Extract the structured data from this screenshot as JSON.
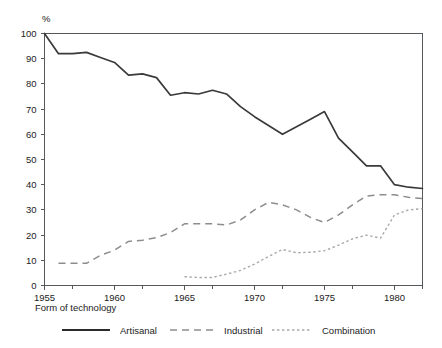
{
  "chart_data": {
    "type": "line",
    "title": "",
    "subtitle": "",
    "xlabel": "",
    "ylabel": "%",
    "unit_label": "%",
    "xlim": [
      1955,
      1982
    ],
    "ylim": [
      0,
      100
    ],
    "grid": false,
    "legend_position": "bottom",
    "legend_title": "Form of technology",
    "x_ticks": [
      1955,
      1960,
      1965,
      1970,
      1975,
      1980
    ],
    "x_tick_labels": [
      "1955",
      "1960",
      "1965",
      "1970",
      "1975",
      "1980"
    ],
    "x_minor_ticks": [
      1957,
      1962,
      1967,
      1972,
      1977,
      1982
    ],
    "y_ticks": [
      0,
      10,
      20,
      30,
      40,
      50,
      60,
      70,
      80,
      90,
      100
    ],
    "y_tick_labels": [
      "0",
      "10",
      "20",
      "30",
      "40",
      "50",
      "60",
      "70",
      "80",
      "90",
      "100"
    ],
    "series": [
      {
        "name": "Artisanal",
        "style": "solid",
        "color": "#3a3a3a",
        "x": [
          1955,
          1956,
          1957,
          1958,
          1959,
          1960,
          1961,
          1962,
          1963,
          1964,
          1965,
          1966,
          1967,
          1968,
          1969,
          1970,
          1971,
          1972,
          1973,
          1974,
          1975,
          1976,
          1977,
          1978,
          1979,
          1980,
          1981,
          1982
        ],
        "values": [
          100,
          92,
          92,
          92.5,
          90.5,
          88.5,
          83.5,
          84,
          82.5,
          75.5,
          76.5,
          76,
          77.5,
          76,
          71,
          67,
          63.5,
          60,
          63,
          66,
          69,
          58.5,
          53,
          47.5,
          47.5,
          40,
          39,
          38.5
        ]
      },
      {
        "name": "Industrial",
        "style": "dashed",
        "color": "#8d8d8d",
        "x": [
          1956,
          1957,
          1958,
          1959,
          1960,
          1961,
          1962,
          1963,
          1964,
          1965,
          1966,
          1967,
          1968,
          1969,
          1970,
          1971,
          1972,
          1973,
          1974,
          1975,
          1976,
          1977,
          1978,
          1979,
          1980,
          1981,
          1982
        ],
        "values": [
          8.8,
          8.8,
          8.8,
          12,
          14,
          17.5,
          18,
          19,
          21,
          24.5,
          24.5,
          24.5,
          24,
          26,
          30,
          33,
          32,
          30,
          27,
          25,
          28,
          32,
          35.5,
          36,
          36,
          35,
          34.5
        ]
      },
      {
        "name": "Combination",
        "style": "dotted",
        "color": "#a8a8a8",
        "x": [
          1965,
          1966,
          1967,
          1968,
          1969,
          1970,
          1971,
          1972,
          1973,
          1974,
          1975,
          1976,
          1977,
          1978,
          1979,
          1980,
          1981,
          1982
        ],
        "values": [
          3.5,
          3.2,
          3.2,
          4.5,
          6,
          8.5,
          11.5,
          14.3,
          13,
          13.2,
          13.8,
          16,
          18.5,
          20,
          18.8,
          28,
          30,
          30.5
        ]
      }
    ]
  },
  "legend": {
    "title": "Form of technology",
    "entries": [
      {
        "label": "Artisanal",
        "style": "solid",
        "color": "#3a3a3a"
      },
      {
        "label": "Industrial",
        "style": "dashed",
        "color": "#8d8d8d"
      },
      {
        "label": "Combination",
        "style": "dotted",
        "color": "#a8a8a8"
      }
    ]
  },
  "axes": {
    "y_unit": "%",
    "y_labels": [
      "100",
      "90",
      "80",
      "70",
      "60",
      "50",
      "40",
      "30",
      "20",
      "10",
      "0"
    ],
    "x_labels": [
      "1955",
      "1960",
      "1965",
      "1970",
      "1975",
      "1980"
    ]
  }
}
